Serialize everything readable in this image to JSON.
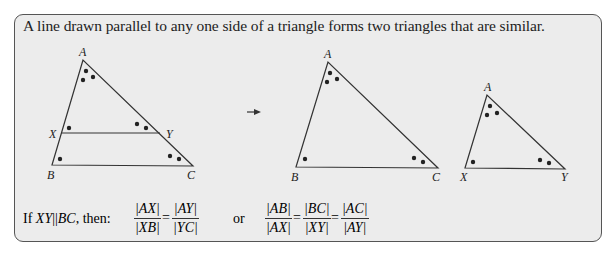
{
  "panel": {
    "statement": "A line drawn parallel to any one side of a triangle forms two triangles that are similar."
  },
  "figure1": {
    "vertices": {
      "A": "A",
      "X": "X",
      "Y": "Y",
      "B": "B",
      "C": "C"
    }
  },
  "figure2": {
    "vertices": {
      "A": "A",
      "B": "B",
      "C": "C"
    }
  },
  "figure3": {
    "vertices": {
      "A": "A",
      "X": "X",
      "Y": "Y"
    }
  },
  "arrow": {
    "icon": "right-arrow-icon"
  },
  "formula": {
    "condition_prefix": "If ",
    "condition_lhs": "XY",
    "parallel_symbol": "||",
    "condition_rhs": "BC",
    "condition_suffix": ", then:",
    "ratio1": {
      "num1": "|AX|",
      "den1": "|XB|",
      "equals": "=",
      "num2": "|AY|",
      "den2": "|YC|"
    },
    "connector": "or",
    "ratio2": {
      "num1": "|AB|",
      "den1": "|AX|",
      "equals1": "=",
      "num2": "|BC|",
      "den2": "|XY|",
      "equals2": "=",
      "num3": "|AC|",
      "den3": "|AY|"
    }
  },
  "colors": {
    "panel_bg": "#ececec",
    "border": "#555555",
    "line": "#333333",
    "text": "#222222"
  }
}
